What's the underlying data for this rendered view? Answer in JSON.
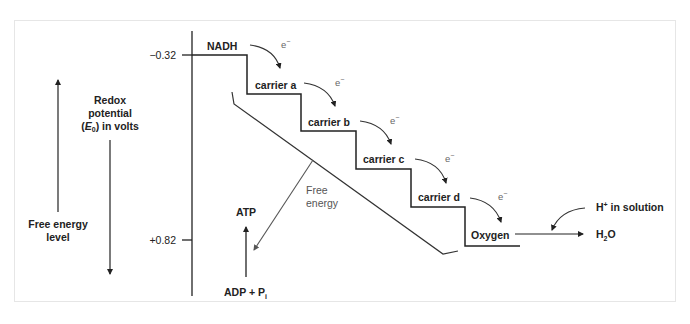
{
  "diagram": {
    "axis": {
      "label_line1": "Redox",
      "label_line2": "potential",
      "label_line3_pre": "(",
      "label_line3_E": "E",
      "label_line3_sub": "0",
      "label_line3_post": ") in volts",
      "tick_top": "−0.32",
      "tick_bottom": "+0.82"
    },
    "free_energy_level": {
      "line1": "Free energy",
      "line2": "level"
    },
    "steps": [
      {
        "name": "NADH"
      },
      {
        "name": "carrier a"
      },
      {
        "name": "carrier b"
      },
      {
        "name": "carrier c"
      },
      {
        "name": "carrier d"
      },
      {
        "name": "Oxygen"
      }
    ],
    "electron_label": "e",
    "electron_sup": "−",
    "free_energy_label_line1": "Free",
    "free_energy_label_line2": "energy",
    "atp": "ATP",
    "adp_pre": "ADP + P",
    "adp_sub": "i",
    "h_plus_pre": "H",
    "h_plus_sup": "+",
    "h_plus_post": " in solution",
    "water_pre": "H",
    "water_sub": "2",
    "water_post": "O",
    "colors": {
      "line": "#222222",
      "gray_arrow": "#555555",
      "frame": "#e6e6e6"
    }
  }
}
